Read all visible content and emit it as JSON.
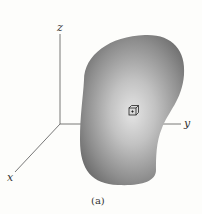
{
  "figure": {
    "caption": "(a)",
    "axes": {
      "x_label": "x",
      "y_label": "y",
      "z_label": "z"
    },
    "body": {
      "description": "arbitrary 3D body with shaded surface",
      "edge_color": "#6e6e6e",
      "center_color": "#e2e2e2"
    },
    "element": {
      "description": "small cubic volume element with a dot at center"
    }
  }
}
